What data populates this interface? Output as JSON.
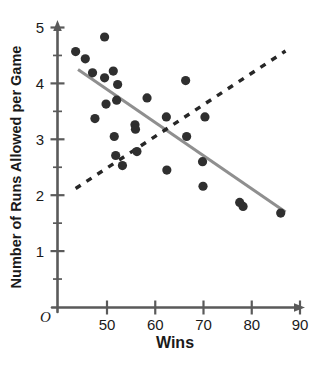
{
  "chart_data": {
    "type": "scatter",
    "title": "",
    "xlabel": "Wins",
    "ylabel": "Number of Runs Allowed per Game",
    "xlim": [
      42,
      92
    ],
    "ylim": [
      0,
      5
    ],
    "xticks": [
      50,
      60,
      70,
      80,
      90
    ],
    "yticks": [
      1,
      2,
      3,
      4,
      5
    ],
    "xtick_labels": [
      "50",
      "60",
      "70",
      "80",
      "90"
    ],
    "ytick_labels": [
      "1",
      "2",
      "3",
      "4",
      "5"
    ],
    "y_minor_ticks": [
      0.5,
      1.5,
      2.5,
      3.5,
      4.5
    ],
    "grid": false,
    "legend": "none",
    "origin_label": "O",
    "points": [
      {
        "x": 43.5,
        "y": 4.57
      },
      {
        "x": 45.5,
        "y": 4.44
      },
      {
        "x": 47.0,
        "y": 4.19
      },
      {
        "x": 47.5,
        "y": 3.37
      },
      {
        "x": 49.5,
        "y": 4.83
      },
      {
        "x": 49.5,
        "y": 4.1
      },
      {
        "x": 49.8,
        "y": 3.63
      },
      {
        "x": 51.3,
        "y": 4.22
      },
      {
        "x": 51.5,
        "y": 3.05
      },
      {
        "x": 51.8,
        "y": 2.71
      },
      {
        "x": 52.0,
        "y": 3.7
      },
      {
        "x": 52.2,
        "y": 3.98
      },
      {
        "x": 53.2,
        "y": 2.53
      },
      {
        "x": 55.8,
        "y": 3.26
      },
      {
        "x": 55.9,
        "y": 3.18
      },
      {
        "x": 56.2,
        "y": 2.78
      },
      {
        "x": 58.3,
        "y": 3.74
      },
      {
        "x": 62.3,
        "y": 3.4
      },
      {
        "x": 62.4,
        "y": 2.45
      },
      {
        "x": 66.3,
        "y": 4.05
      },
      {
        "x": 66.5,
        "y": 3.05
      },
      {
        "x": 69.8,
        "y": 2.6
      },
      {
        "x": 69.9,
        "y": 2.16
      },
      {
        "x": 70.3,
        "y": 3.4
      },
      {
        "x": 77.5,
        "y": 1.87
      },
      {
        "x": 78.2,
        "y": 1.8
      },
      {
        "x": 86.0,
        "y": 1.68
      }
    ],
    "series": [
      {
        "name": "solid-trend-line",
        "style": "solid",
        "color": "#8f8f8f",
        "x": [
          44.0,
          87.0
        ],
        "y": [
          4.25,
          1.7
        ]
      },
      {
        "name": "dashed-trend-line",
        "style": "dashed",
        "color": "#272727",
        "x": [
          43.5,
          87.0
        ],
        "y": [
          2.12,
          4.58
        ]
      }
    ],
    "point_color": "#2f2f2f",
    "axis_color": "#5a5a5a"
  }
}
